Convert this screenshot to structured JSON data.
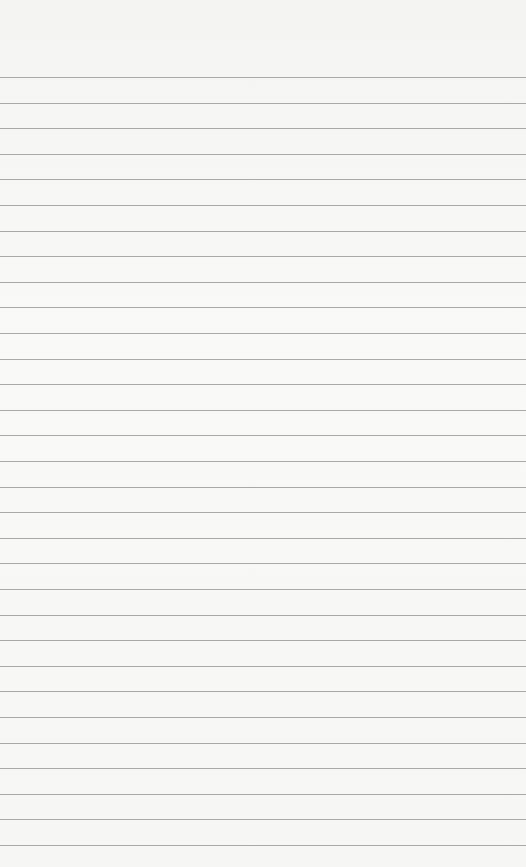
{
  "paper": {
    "type": "lined-paper",
    "background_color": "#f7f7f6",
    "line_color": "#8f8f8f",
    "first_line_y": 77,
    "line_spacing": 25.6,
    "line_count": 31
  }
}
